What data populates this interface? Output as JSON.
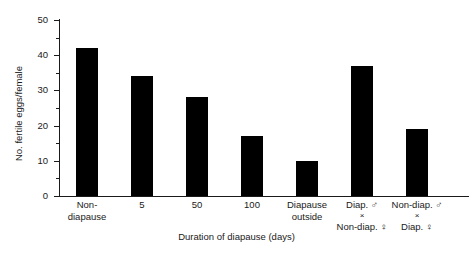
{
  "chart_data": {
    "type": "bar",
    "title": "",
    "xlabel": "Duration of diapause (days)",
    "ylabel": "No. fertile eggs/female",
    "ylim": [
      0,
      50
    ],
    "yticks": [
      0,
      10,
      20,
      30,
      40,
      50
    ],
    "yminor_ticks": [
      5,
      15,
      25,
      35,
      45
    ],
    "grid": false,
    "legend": "none",
    "bar_color": "#000000",
    "axis_color": "#1a1a1a",
    "categories": [
      "Non-\ndiapause",
      "5",
      "50",
      "100",
      "Diapause\noutside",
      "Diap. ♂\n×\nNon-diap. ♀",
      "Non-diap. ♂\n×\nDiap. ♀"
    ],
    "category_lines": [
      [
        "Non-",
        "diapause"
      ],
      [
        "5"
      ],
      [
        "50"
      ],
      [
        "100"
      ],
      [
        "Diapause",
        "outside"
      ],
      [
        "Diap. ♂",
        "×",
        "Non-diap. ♀"
      ],
      [
        "Non-diap. ♂",
        "×",
        "Diap. ♀"
      ]
    ],
    "values": [
      42,
      34,
      28,
      17,
      10,
      37,
      19
    ]
  },
  "axis": {
    "y_tick_labels": [
      "0",
      "10",
      "20",
      "30",
      "40",
      "50"
    ],
    "y_axis_title": "No. fertile eggs/female",
    "x_axis_title": "Duration of diapause (days)"
  }
}
